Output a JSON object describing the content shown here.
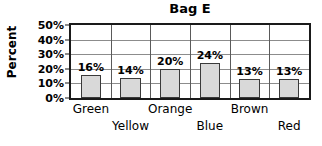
{
  "chart_data": {
    "type": "bar",
    "title": "Bag E",
    "xlabel": "",
    "ylabel": "Percent",
    "categories": [
      "Green",
      "Yellow",
      "Orange",
      "Blue",
      "Brown",
      "Red"
    ],
    "values": [
      16,
      14,
      20,
      24,
      13,
      13
    ],
    "value_labels": [
      "16%",
      "14%",
      "20%",
      "24%",
      "13%",
      "13%"
    ],
    "ylim": [
      0,
      50
    ],
    "y_ticks": [
      0,
      10,
      20,
      30,
      40,
      50
    ],
    "y_tick_labels": [
      "0%",
      "10%",
      "20%",
      "30%",
      "40%",
      "50%"
    ],
    "grid": true,
    "grid_axis": "y",
    "legend": false,
    "bar_fill_color": "#d9d9d9",
    "bar_edge_color": "#3a3a3a",
    "axis_color": "#1a1a1a",
    "gridline_color": "#8c8c8c"
  },
  "axis": {
    "y_title": "Percent"
  },
  "bars": [
    {
      "category": "Green",
      "value": 16,
      "label": "16%",
      "label_row": 0
    },
    {
      "category": "Yellow",
      "value": 14,
      "label": "14%",
      "label_row": 1
    },
    {
      "category": "Orange",
      "value": 20,
      "label": "20%",
      "label_row": 0
    },
    {
      "category": "Blue",
      "value": 24,
      "label": "24%",
      "label_row": 1
    },
    {
      "category": "Brown",
      "value": 13,
      "label": "13%",
      "label_row": 0
    },
    {
      "category": "Red",
      "value": 13,
      "label": "13%",
      "label_row": 1
    }
  ]
}
